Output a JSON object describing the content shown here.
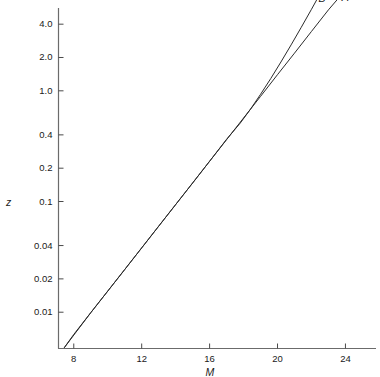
{
  "chart_data": {
    "type": "line",
    "title": "",
    "xlabel": "M",
    "ylabel": "z",
    "yscale": "log",
    "xscale": "linear",
    "grid": false,
    "legend": "inline-curve-labels",
    "xlim": [
      7.1,
      25.8
    ],
    "ylim": [
      0.0047,
      5.6
    ],
    "x_ticks": [
      {
        "value": 8,
        "label": "8"
      },
      {
        "value": 12,
        "label": "12"
      },
      {
        "value": 16,
        "label": "16"
      },
      {
        "value": 20,
        "label": "20"
      },
      {
        "value": 24,
        "label": "24"
      }
    ],
    "y_ticks": [
      {
        "value": 4.0,
        "label": "4.0"
      },
      {
        "value": 2.0,
        "label": "2.0"
      },
      {
        "value": 1.0,
        "label": "1.0"
      },
      {
        "value": 0.4,
        "label": "0.4"
      },
      {
        "value": 0.2,
        "label": "0.2"
      },
      {
        "value": 0.1,
        "label": "0.1"
      },
      {
        "value": 0.04,
        "label": "0.04"
      },
      {
        "value": 0.02,
        "label": "0.02"
      },
      {
        "value": 0.01,
        "label": "0.01"
      }
    ],
    "series": [
      {
        "name": "A",
        "label": "A",
        "color": "#2b2b2b",
        "points": [
          [
            7.45,
            0.0048
          ],
          [
            8.0,
            0.0063
          ],
          [
            9.0,
            0.0099
          ],
          [
            10.0,
            0.0155
          ],
          [
            11.0,
            0.0243
          ],
          [
            12.0,
            0.0381
          ],
          [
            13.0,
            0.0598
          ],
          [
            14.0,
            0.0938
          ],
          [
            15.0,
            0.147
          ],
          [
            16.0,
            0.231
          ],
          [
            17.0,
            0.362
          ],
          [
            18.0,
            0.568
          ],
          [
            19.0,
            0.891
          ],
          [
            20.0,
            1.4
          ],
          [
            21.0,
            2.19
          ],
          [
            22.0,
            3.44
          ],
          [
            23.0,
            5.39
          ],
          [
            23.6,
            6.9
          ]
        ]
      },
      {
        "name": "B",
        "label": "B",
        "color": "#2b2b2b",
        "points": [
          [
            7.45,
            0.0048
          ],
          [
            9.0,
            0.0099
          ],
          [
            11.0,
            0.0243
          ],
          [
            13.0,
            0.0598
          ],
          [
            15.0,
            0.147
          ],
          [
            16.0,
            0.231
          ],
          [
            17.0,
            0.365
          ],
          [
            17.8,
            0.51
          ],
          [
            18.4,
            0.68
          ],
          [
            19.0,
            0.93
          ],
          [
            19.6,
            1.29
          ],
          [
            20.2,
            1.82
          ],
          [
            20.8,
            2.6
          ],
          [
            21.4,
            3.75
          ],
          [
            22.0,
            5.45
          ],
          [
            22.3,
            6.6
          ]
        ]
      }
    ]
  },
  "axes": {
    "x_title": "M",
    "y_title": "z"
  },
  "curve_labels": {
    "a": "A",
    "b": "B"
  }
}
